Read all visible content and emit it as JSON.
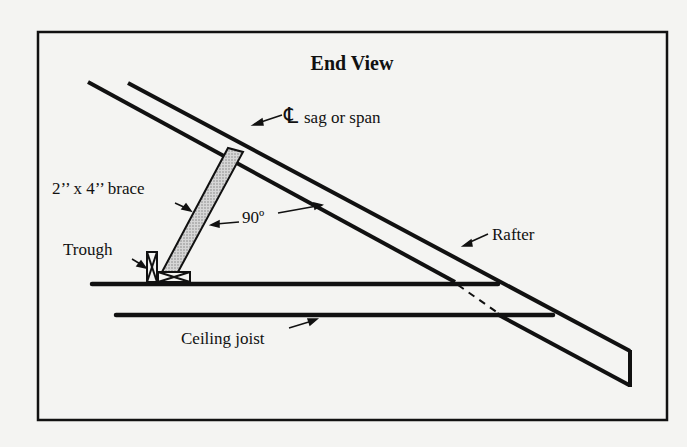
{
  "diagram": {
    "title": "End View",
    "labels": {
      "centerline": "℄",
      "centerline_note": "sag or span",
      "brace": "2’’ x 4’’ brace",
      "angle": "90º",
      "trough": "Trough",
      "rafter": "Rafter",
      "ceiling_joist": "Ceiling joist"
    },
    "colors": {
      "ink": "#111111",
      "paper": "#f4f4f2",
      "brace_fill": "#bdbdbd"
    }
  }
}
